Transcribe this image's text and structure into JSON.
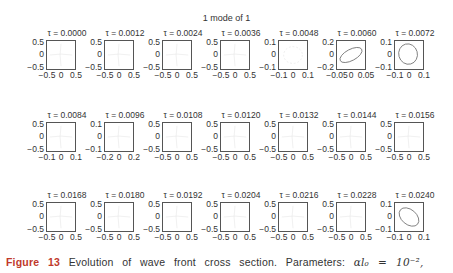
{
  "figure": {
    "suptitle": "1 mode of 1",
    "caption_label": "Figure",
    "caption_number": "13",
    "caption_text": "Evolution of wave front cross section. Parameters:",
    "caption_param": "αl₀ = 10⁻²,"
  },
  "chart_data": {
    "type": "scatter",
    "title": "1 mode of 1",
    "layout": {
      "rows": 3,
      "cols": 7
    },
    "panels": [
      {
        "tau": "τ = 0.0000",
        "yticks": [
          "0.5",
          "0",
          "−0.5"
        ],
        "xticks": [
          "−0.5",
          "0",
          "0.5"
        ],
        "shape": "faint"
      },
      {
        "tau": "τ = 0.0012",
        "yticks": [
          "0.5",
          "0",
          "−0.5"
        ],
        "xticks": [
          "−0.5",
          "0",
          "0.5"
        ],
        "shape": "faint"
      },
      {
        "tau": "τ = 0.0024",
        "yticks": [
          "0.5",
          "0",
          "−0.5"
        ],
        "xticks": [
          "−0.5",
          "0",
          "0.5"
        ],
        "shape": "faint"
      },
      {
        "tau": "τ = 0.0036",
        "yticks": [
          "0.5",
          "0",
          "−0.5"
        ],
        "xticks": [
          "−0.5",
          "0",
          "0.5"
        ],
        "shape": "faint"
      },
      {
        "tau": "τ = 0.0048",
        "yticks": [
          "0.1",
          "0",
          "−0.1"
        ],
        "xticks": [
          "−0.1",
          "0",
          "0.1"
        ],
        "shape": "faint-ellipse"
      },
      {
        "tau": "τ = 0.0060",
        "yticks": [
          "0.2",
          "0",
          "−0.2"
        ],
        "xticks": [
          "−0.05",
          "0",
          "0.05"
        ],
        "shape": "tilted-ellipse"
      },
      {
        "tau": "τ = 0.0072",
        "yticks": [
          "0.1",
          "0",
          "−0.1"
        ],
        "xticks": [
          "−0.1",
          "0",
          "0.1"
        ],
        "shape": "ellipse"
      },
      {
        "tau": "τ = 0.0084",
        "yticks": [
          "0.5",
          "0",
          "−0.5"
        ],
        "xticks": [
          "−0.1",
          "0",
          "0.1"
        ],
        "shape": "faint"
      },
      {
        "tau": "τ = 0.0096",
        "yticks": [
          "0.1",
          "0",
          "−0.1"
        ],
        "xticks": [
          "−0.2",
          "0",
          "0.2"
        ],
        "shape": "faint"
      },
      {
        "tau": "τ = 0.0108",
        "yticks": [
          "0.5",
          "0",
          "−0.5"
        ],
        "xticks": [
          "−0.5",
          "0",
          "0.5"
        ],
        "shape": "faint"
      },
      {
        "tau": "τ = 0.0120",
        "yticks": [
          "0.5",
          "0",
          "−0.5"
        ],
        "xticks": [
          "−0.5",
          "0",
          "0.5"
        ],
        "shape": "faint"
      },
      {
        "tau": "τ = 0.0132",
        "yticks": [
          "0.5",
          "0",
          "−0.5"
        ],
        "xticks": [
          "−0.5",
          "0",
          "0.5"
        ],
        "shape": "faint"
      },
      {
        "tau": "τ = 0.0144",
        "yticks": [
          "0.5",
          "0",
          "−0.5"
        ],
        "xticks": [
          "−0.5",
          "0",
          "0.5"
        ],
        "shape": "faint"
      },
      {
        "tau": "τ = 0.0156",
        "yticks": [
          "0.5",
          "0",
          "−0.5"
        ],
        "xticks": [
          "−0.5",
          "0",
          "0.5"
        ],
        "shape": "faint"
      },
      {
        "tau": "τ = 0.0168",
        "yticks": [
          "0.5",
          "0",
          "−0.5"
        ],
        "xticks": [
          "−0.5",
          "0",
          "0.5"
        ],
        "shape": "faint"
      },
      {
        "tau": "τ = 0.0180",
        "yticks": [
          "0.5",
          "0",
          "−0.5"
        ],
        "xticks": [
          "−0.5",
          "0",
          "0.5"
        ],
        "shape": "faint"
      },
      {
        "tau": "τ = 0.0192",
        "yticks": [
          "0.5",
          "0",
          "−0.5"
        ],
        "xticks": [
          "−0.5",
          "0",
          "0.5"
        ],
        "shape": "faint"
      },
      {
        "tau": "τ = 0.0204",
        "yticks": [
          "0.5",
          "0",
          "−0.5"
        ],
        "xticks": [
          "−0.5",
          "0",
          "0.5"
        ],
        "shape": "faint"
      },
      {
        "tau": "τ = 0.0216",
        "yticks": [
          "0.5",
          "0",
          "−0.5"
        ],
        "xticks": [
          "−0.5",
          "0",
          "0.5"
        ],
        "shape": "faint"
      },
      {
        "tau": "τ = 0.0228",
        "yticks": [
          "0.5",
          "0",
          "−0.5"
        ],
        "xticks": [
          "−0.5",
          "0",
          "0.5"
        ],
        "shape": "faint"
      },
      {
        "tau": "τ = 0.0240",
        "yticks": [
          "0.1",
          "0",
          "−0.1"
        ],
        "xticks": [
          "−0.1",
          "0",
          "0.1"
        ],
        "shape": "tilted-ellipse-neg"
      }
    ]
  }
}
